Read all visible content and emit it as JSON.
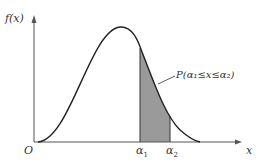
{
  "diagram": {
    "y_axis_label": "f(x)",
    "x_axis_label": "x",
    "origin_label": "O",
    "a1_label": "α",
    "a1_sub": "1",
    "a2_label": "α",
    "a2_sub": "2",
    "annotation": "P(α₁≤x≤α₂)",
    "colors": {
      "curve": "#222222",
      "axis": "#555555",
      "shade": "#9a9a9a"
    }
  }
}
